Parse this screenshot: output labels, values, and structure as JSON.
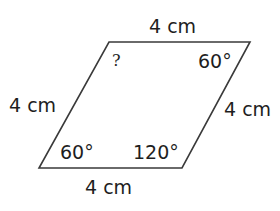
{
  "figure": {
    "shape": "rhombus",
    "stroke_color": "#3a3a3a",
    "sides": {
      "top": "4 cm",
      "left": "4 cm",
      "right": "4 cm",
      "bottom": "4 cm"
    },
    "angles": {
      "top_left": "?",
      "top_right": "60°",
      "bottom_left": "60°",
      "bottom_right": "120°"
    }
  }
}
